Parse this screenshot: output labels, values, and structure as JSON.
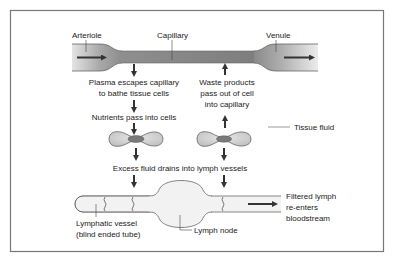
{
  "diagram": {
    "labels": {
      "arteriole": "Arteriole",
      "capillary": "Capillary",
      "venule": "Venule",
      "plasma_line1": "Plasma escapes capillary",
      "plasma_line2": "to bathe tissue cells",
      "nutrients": "Nutrients pass into cells",
      "waste_line1": "Waste products",
      "waste_line2": "pass out of cell",
      "waste_line3": "into capillary",
      "tissue_fluid": "Tissue fluid",
      "excess_fluid": "Excess fluid drains into lymph vessels",
      "lymphatic_line1": "Lymphatic vessel",
      "lymphatic_line2": "(blind ended tube)",
      "lymph_node": "Lymph node",
      "filtered_line1": "Filtered lymph",
      "filtered_line2": "re-enters",
      "filtered_line3": "bloodstream"
    },
    "colors": {
      "frame": "#777777",
      "vessel_dark": "#8a8a8a",
      "vessel_light": "#e6e6e6",
      "cell_fill": "#d4d4d4",
      "nucleus": "#7a7a7a",
      "arrow": "#333333",
      "lymph_fill": "#f2f2f2"
    }
  }
}
